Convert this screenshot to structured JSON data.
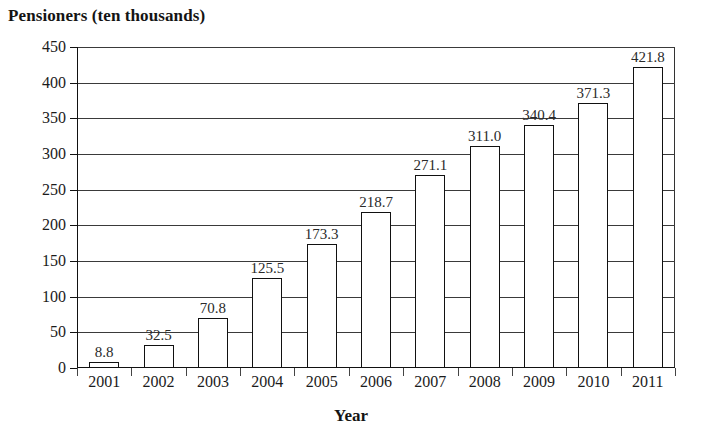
{
  "chart_data": {
    "type": "bar",
    "title": "Pensioners (ten thousands)",
    "xlabel": "Year",
    "ylabel": "",
    "categories": [
      "2001",
      "2002",
      "2003",
      "2004",
      "2005",
      "2006",
      "2007",
      "2008",
      "2009",
      "2010",
      "2011"
    ],
    "values": [
      8.8,
      32.5,
      70.8,
      125.5,
      173.3,
      218.7,
      271.1,
      311.0,
      340.4,
      371.3,
      421.8
    ],
    "value_labels": [
      "8.8",
      "32.5",
      "70.8",
      "125.5",
      "173.3",
      "218.7",
      "271.1",
      "311.0",
      "340.4",
      "371.3",
      "421.8"
    ],
    "ylim": [
      0,
      450
    ],
    "ytick_step": 50,
    "ytick_labels": [
      "0",
      "50",
      "100",
      "150",
      "200",
      "250",
      "300",
      "350",
      "400",
      "450"
    ],
    "ytick_values": [
      0,
      50,
      100,
      150,
      200,
      250,
      300,
      350,
      400,
      450
    ],
    "grid": true,
    "grid_axis": "y",
    "legend": false,
    "legend_position": "none",
    "bar_fill_color": "#ffffff",
    "bar_border_color": "#111111",
    "grid_color": "#3a3a3a",
    "background_color": "#ffffff",
    "text_color": "#1a1a1a",
    "data_labels_shown": true
  }
}
